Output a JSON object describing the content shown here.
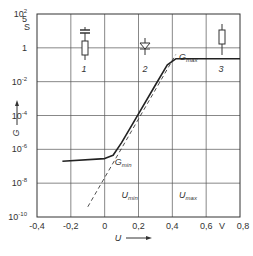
{
  "chart_data": {
    "type": "line",
    "title": "",
    "xlabel": "U",
    "ylabel": "G",
    "x_unit": "V",
    "y_unit": "S",
    "xscale": "linear",
    "yscale": "log",
    "xlim": [
      -0.4,
      0.8
    ],
    "ylim_exponent": [
      -10,
      2
    ],
    "grid": true,
    "x_ticks": [
      "-0,4",
      "-0,2",
      "0",
      "0,2",
      "0,4",
      "0,6",
      "0,8"
    ],
    "x_tick_values": [
      -0.4,
      -0.2,
      0,
      0.2,
      0.4,
      0.6,
      0.8
    ],
    "y_ticks": [
      {
        "label": "10",
        "exp": "2",
        "value_exp": 2
      },
      {
        "label": "5",
        "exp": "",
        "value_exp": 1.7
      },
      {
        "label": "1",
        "exp": "",
        "value_exp": 0
      },
      {
        "label": "10",
        "exp": "-2",
        "value_exp": -2
      },
      {
        "label": "10",
        "exp": "-4",
        "value_exp": -4
      },
      {
        "label": "10",
        "exp": "-6",
        "value_exp": -6
      },
      {
        "label": "10",
        "exp": "-8",
        "value_exp": -8
      },
      {
        "label": "10",
        "exp": "-10",
        "value_exp": -10
      }
    ],
    "series": [
      {
        "name": "G(U) characteristic",
        "style": "solid",
        "points_log10": [
          [
            -0.25,
            -6.7
          ],
          [
            0.0,
            -6.55
          ],
          [
            0.05,
            -6.35
          ],
          [
            0.1,
            -5.6
          ],
          [
            0.2,
            -3.9
          ],
          [
            0.3,
            -2.2
          ],
          [
            0.37,
            -1.0
          ],
          [
            0.42,
            -0.65
          ],
          [
            0.8,
            -0.65
          ]
        ]
      },
      {
        "name": "exponential extrapolation",
        "style": "dashed",
        "points_log10": [
          [
            -0.1,
            -9.4
          ],
          [
            0.42,
            -0.4
          ]
        ]
      }
    ],
    "annotations": [
      {
        "text": "G",
        "sub": "min",
        "x": 0.06,
        "y_exp": -6.9
      },
      {
        "text": "G",
        "sub": "max",
        "x": 0.44,
        "y_exp": -0.7
      },
      {
        "text": "U",
        "sub": "min",
        "x": 0.1,
        "y_exp": -8.9
      },
      {
        "text": "U",
        "sub": "max",
        "x": 0.44,
        "y_exp": -8.9
      }
    ],
    "region_labels": [
      "1",
      "2",
      "3"
    ],
    "region_symbols": [
      "capacitor-with-resistor-icon",
      "diode-icon",
      "resistor-icon"
    ]
  }
}
